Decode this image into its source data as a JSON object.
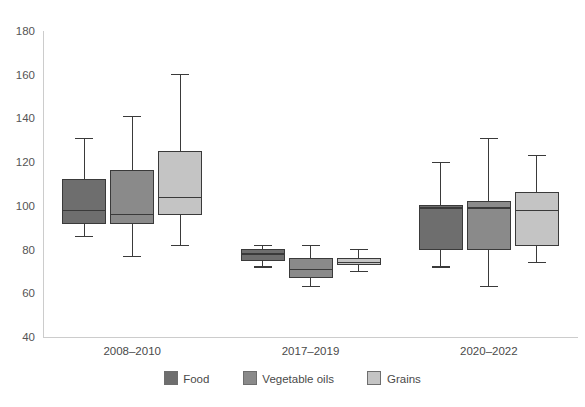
{
  "chart_data": {
    "type": "box",
    "title": "",
    "subtitle": "",
    "xlabel": "",
    "ylabel": "",
    "ylim": [
      40,
      180
    ],
    "ytick_step": 20,
    "yticks": [
      "180",
      "160",
      "140",
      "120",
      "100",
      "80",
      "60",
      "40"
    ],
    "grid": false,
    "legend_position": "bottom",
    "categories": [
      "2008–2010",
      "2017–2019",
      "2020–2022"
    ],
    "series": [
      {
        "name": "Food",
        "color": "#6e6e6e",
        "boxes": [
          {
            "category": "2008–2010",
            "whisker_low": 86,
            "q1": 92,
            "median": 98,
            "q3": 112,
            "whisker_high": 131
          },
          {
            "category": "2017–2019",
            "whisker_low": 72,
            "q1": 75,
            "median": 78,
            "q3": 80,
            "whisker_high": 82
          },
          {
            "category": "2020–2022",
            "whisker_low": 72,
            "q1": 80,
            "median": 99,
            "q3": 100,
            "whisker_high": 120
          }
        ]
      },
      {
        "name": "Vegetable oils",
        "color": "#8a8a8a",
        "boxes": [
          {
            "category": "2008–2010",
            "whisker_low": 77,
            "q1": 92,
            "median": 96,
            "q3": 116,
            "whisker_high": 141
          },
          {
            "category": "2017–2019",
            "whisker_low": 63,
            "q1": 67,
            "median": 71,
            "q3": 76,
            "whisker_high": 82
          },
          {
            "category": "2020–2022",
            "whisker_low": 63,
            "q1": 80,
            "median": 99,
            "q3": 102,
            "whisker_high": 131
          }
        ]
      },
      {
        "name": "Grains",
        "color": "#c4c4c4",
        "boxes": [
          {
            "category": "2008–2010",
            "whisker_low": 82,
            "q1": 96,
            "median": 104,
            "q3": 125,
            "whisker_high": 160
          },
          {
            "category": "2017–2019",
            "whisker_low": 70,
            "q1": 73,
            "median": 74,
            "q3": 76,
            "whisker_high": 80
          },
          {
            "category": "2020–2022",
            "whisker_low": 74,
            "q1": 82,
            "median": 98,
            "q3": 106,
            "whisker_high": 123
          }
        ]
      }
    ]
  },
  "legend": {
    "items": [
      {
        "label": "Food",
        "color": "#6e6e6e"
      },
      {
        "label": "Vegetable oils",
        "color": "#8a8a8a"
      },
      {
        "label": "Grains",
        "color": "#c4c4c4"
      }
    ]
  },
  "axes": {
    "y_tick_labels": [
      "180",
      "160",
      "140",
      "120",
      "100",
      "80",
      "60",
      "40"
    ],
    "x_tick_labels": [
      "2008–2010",
      "2017–2019",
      "2020–2022"
    ]
  },
  "colors": {
    "background": "#ffffff",
    "axis": "#cccccc",
    "stroke": "#3a3a3a",
    "text": "#4a4a4a"
  }
}
